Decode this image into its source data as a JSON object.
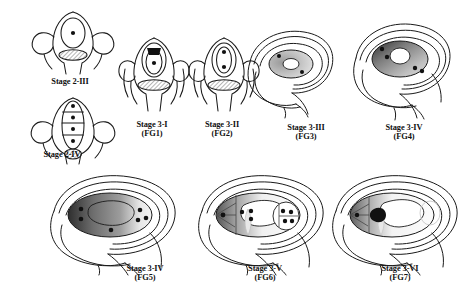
{
  "figure": {
    "background_color": "#ffffff",
    "line_color": "#1a1a1a",
    "nucleus_color": "#111111",
    "cytoplasm_light": "#d8d8d8",
    "cytoplasm_mid": "#9e9e9e",
    "cytoplasm_dark": "#4a4a4a"
  },
  "panels": [
    {
      "id": "stage-2-iii",
      "stage_label": "Stage 2-III",
      "fg_label": "",
      "nuclei_count": 1,
      "description": "megaspore mother cell with single nucleus above hatched nucellus base"
    },
    {
      "id": "stage-2-iv",
      "stage_label": "Stage 2-IV",
      "fg_label": "",
      "nuclei_count": 4,
      "description": "tetrad of four megaspores stacked linearly each with a nucleus"
    },
    {
      "id": "stage-3-i",
      "stage_label": "Stage 3-I",
      "fg_label": "(FG1)",
      "nuclei_count": 1,
      "description": "functional megaspore with one nucleus and degenerating dark cap"
    },
    {
      "id": "stage-3-ii",
      "stage_label": "Stage 3-II",
      "fg_label": "(FG2)",
      "nuclei_count": 2,
      "description": "two-nucleate embryo sac"
    },
    {
      "id": "stage-3-iii",
      "stage_label": "Stage 3-III",
      "fg_label": "(FG3)",
      "nuclei_count": 2,
      "description": "two-nucleate embryo sac with central vacuole, integuments growing"
    },
    {
      "id": "stage-3-iv-fg4",
      "stage_label": "Stage 3-IV",
      "fg_label": "(FG4)",
      "nuclei_count": 4,
      "description": "four-nucleate embryo sac with large central vacuole"
    },
    {
      "id": "stage-3-iv-fg5",
      "stage_label": "Stage 3-IV",
      "fg_label": "(FG5)",
      "nuclei_count": 6,
      "description": "eight-nucleate stage, enlarged embryo sac with central vacuole"
    },
    {
      "id": "stage-3-v",
      "stage_label": "Stage 3-V",
      "fg_label": "(FG6)",
      "nuclei_count": 7,
      "description": "cellularized embryo sac, antipodals, egg apparatus and polar nuclei"
    },
    {
      "id": "stage-3-vi",
      "stage_label": "Stage 3-VI",
      "fg_label": "(FG7)",
      "nuclei_count": 1,
      "description": "mature embryo sac with fused secondary nucleus, antipodals degenerated"
    }
  ]
}
